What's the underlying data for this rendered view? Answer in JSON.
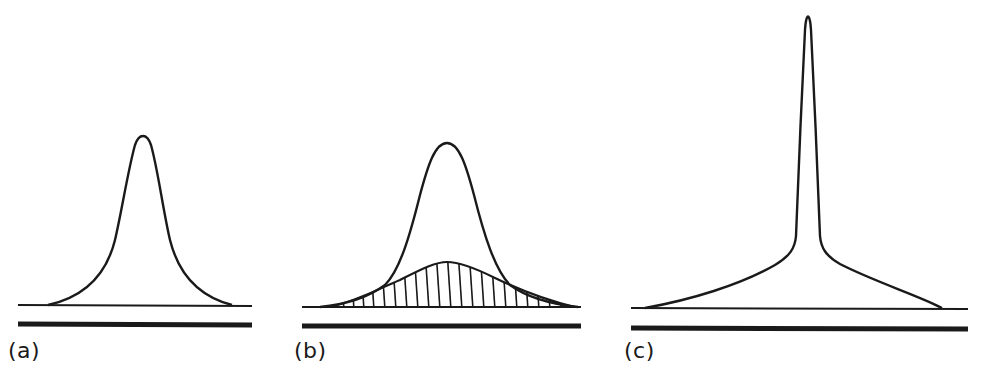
{
  "figure": {
    "panels": [
      {
        "id": "a",
        "label": "(a)",
        "shape": "single peak of moderate width"
      },
      {
        "id": "b",
        "label": "(b)",
        "shape": "peak with a broad hatched component underneath"
      },
      {
        "id": "c",
        "label": "(c)",
        "shape": "narrow central spike on broad wings"
      }
    ],
    "colors": {
      "line": "#1a1a1a",
      "background": "#ffffff"
    }
  }
}
